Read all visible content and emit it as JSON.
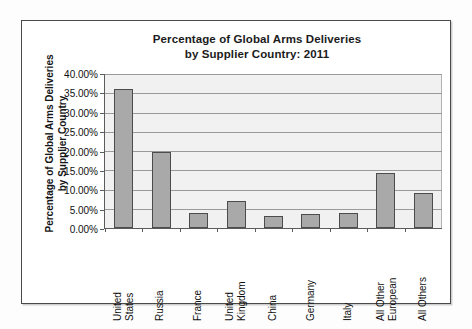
{
  "chart_data": {
    "type": "bar",
    "title": "Percentage of Global Arms Deliveries by Supplier Country: 2011",
    "title_lines": [
      "Percentage of Global Arms Deliveries",
      "by Supplier Country: 2011"
    ],
    "ylabel": "Percentage of Global Arms Deliveries by Supplier Country",
    "ylabel_lines": [
      "Percentage of Global Arms Deliveries",
      "by Supplier Country"
    ],
    "xlabel": "",
    "categories": [
      "United States",
      "Russia",
      "France",
      "United Kingdom",
      "China",
      "Germany",
      "Italy",
      "All Other European",
      "All Others"
    ],
    "category_lines": [
      [
        "United",
        "States"
      ],
      [
        "Russia"
      ],
      [
        "France"
      ],
      [
        "United",
        "Kingdom"
      ],
      [
        "China"
      ],
      [
        "Germany"
      ],
      [
        "Italy"
      ],
      [
        "All Other",
        "European"
      ],
      [
        "All Others"
      ]
    ],
    "values": [
      36.0,
      19.7,
      3.8,
      6.9,
      3.0,
      3.7,
      4.0,
      14.4,
      9.2
    ],
    "value_labels": [
      "36.00%",
      "19.70%",
      "3.80%",
      "6.90%",
      "3.00%",
      "3.70%",
      "4.00%",
      "14.40%",
      "9.20%"
    ],
    "ylim": [
      0,
      40
    ],
    "ytick_values": [
      0,
      5,
      10,
      15,
      20,
      25,
      30,
      35,
      40
    ],
    "ytick_labels": [
      "0.00%",
      "5.00%",
      "10.00%",
      "15.00%",
      "20.00%",
      "25.00%",
      "30.00%",
      "35.00%",
      "40.00%"
    ],
    "grid": true,
    "legend": false,
    "legend_position": "none",
    "colors": {
      "bar_fill": "#a9a9a9",
      "bar_border": "#4c4c4c",
      "plot_background": "#f1f1f1",
      "gridline": "#9a9a9a",
      "axis": "#5c5c5c",
      "text": "#111111",
      "frame_border": "#4a4a4a"
    }
  }
}
